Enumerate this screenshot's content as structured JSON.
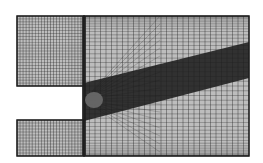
{
  "diagram": {
    "type": "cfd-structured-mesh",
    "colors": {
      "background": "#ffffff",
      "mesh_line": "#1a1a1a",
      "mesh_fill": "#bdbdbd",
      "dense_region": "#1e1e1e"
    },
    "regions": [
      {
        "id": "upper-inlet",
        "x": 17,
        "y": 16,
        "w": 67,
        "h": 70,
        "cols": 22,
        "rows": 24
      },
      {
        "id": "lower-inlet",
        "x": 17,
        "y": 120,
        "w": 67,
        "h": 36,
        "cols": 22,
        "rows": 12
      },
      {
        "id": "main-chamber",
        "x": 84,
        "y": 16,
        "w": 165,
        "h": 140,
        "cols": 30,
        "rows": 46
      }
    ],
    "shear_layer": {
      "start": [
        84,
        103
      ],
      "top_end": [
        249,
        42
      ],
      "bottom_end": [
        249,
        78
      ]
    }
  }
}
